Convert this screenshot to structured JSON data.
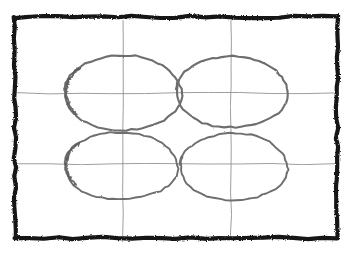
{
  "image": {
    "kind": "hand-drawn-pencil-sketch",
    "title": "Hand-drawn sketch of four ovals in a bordered rectangle",
    "width": 354,
    "height": 253,
    "background_color": "#ffffff"
  },
  "colors": {
    "background": "#ffffff",
    "border_stroke": "#151515",
    "guide_line_stroke": "#8c8c8c",
    "oval_stroke": "#6e6e6e",
    "oval_stroke_dark": "#5a5a5a"
  },
  "border": {
    "label": "outer rectangle border",
    "style": "rough hand-drawn marker line",
    "stroke_color": "#151515",
    "stroke_width": 4.2,
    "left": 15,
    "top": 17,
    "right": 337,
    "bottom": 238
  },
  "guides": {
    "label": "crosshair construction lines",
    "stroke_color": "#8c8c8c",
    "stroke_width": 1,
    "vertical_lines": [
      {
        "name": "vertical-guide-left",
        "x": 123,
        "y1": 20,
        "y2": 236
      },
      {
        "name": "vertical-guide-right",
        "x": 231,
        "y1": 20,
        "y2": 236
      }
    ],
    "horizontal_lines": [
      {
        "name": "horizontal-guide-upper",
        "y": 93,
        "x1": 17,
        "x2": 335
      },
      {
        "name": "horizontal-guide-lower",
        "y": 164,
        "x1": 17,
        "x2": 335
      }
    ]
  },
  "ovals": [
    {
      "name": "oval-top-left",
      "position": "top-left",
      "cx": 123,
      "cy": 93,
      "rx": 58,
      "ry": 38,
      "stroke_color": "#6e6e6e",
      "stroke_width": 2.1,
      "has_overdraw_artifact": true
    },
    {
      "name": "oval-top-right",
      "position": "top-right",
      "cx": 232,
      "cy": 92,
      "rx": 55,
      "ry": 36,
      "stroke_color": "#6e6e6e",
      "stroke_width": 2.1,
      "has_overdraw_artifact": false
    },
    {
      "name": "oval-bottom-left",
      "position": "bottom-left",
      "cx": 121,
      "cy": 166,
      "rx": 56,
      "ry": 34,
      "stroke_color": "#6e6e6e",
      "stroke_width": 1.9,
      "has_overdraw_artifact": true
    },
    {
      "name": "oval-bottom-right",
      "position": "bottom-right",
      "cx": 234,
      "cy": 167,
      "rx": 53,
      "ry": 34,
      "stroke_color": "#6e6e6e",
      "stroke_width": 1.9,
      "has_overdraw_artifact": false
    }
  ],
  "counts": {
    "ovals": 4,
    "vertical_guides": 2,
    "horizontal_guides": 2
  }
}
